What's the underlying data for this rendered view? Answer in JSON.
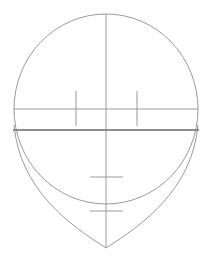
{
  "diagram": {
    "title": "",
    "stroke_color": "#9a9a9a",
    "thick_stroke_color": "#8c8c8c",
    "background": "#ffffff",
    "cranium_circle": {
      "cx": 106,
      "cy": 109,
      "rx": 92,
      "ry": 95
    },
    "center_line": {
      "x": 106,
      "y1": 14,
      "y2": 248
    },
    "eye_line": {
      "y": 109,
      "x1": 14,
      "x2": 198
    },
    "brow_line": {
      "y": 130,
      "x1": 13,
      "x2": 199
    },
    "eye_ticks": [
      {
        "x": 76,
        "y1": 91,
        "y2": 126
      },
      {
        "x": 137,
        "y1": 91,
        "y2": 126
      }
    ],
    "nose_line": {
      "y": 177,
      "x1": 90,
      "x2": 123
    },
    "mouth_line": {
      "y": 211,
      "x1": 90,
      "x2": 123
    },
    "chin_point": {
      "x": 106,
      "y": 248
    }
  }
}
